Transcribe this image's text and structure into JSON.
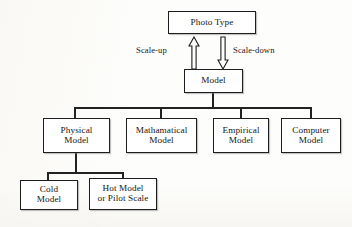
{
  "diagram": {
    "background_color": "#fdfdfb",
    "line_color": "#222222",
    "text_color": "#161616",
    "nodes": {
      "photo_type": "Photo Type",
      "model": "Model",
      "physical_model": "Physical\nModel",
      "mathematical_model": "Mathamatical\nModel",
      "empirical_model": "Empirical\nModel",
      "computer_model": "Computer\nModel",
      "cold_model": "Cold\nModel",
      "hot_model": "Hot Model\nor Pilot Scale"
    },
    "arrows": {
      "scale_up_label": "Scale-up",
      "scale_down_label": "Scale-down",
      "scale_up_icon": "block-arrow-up-icon",
      "scale_down_icon": "block-arrow-down-icon"
    },
    "edges": {
      "model_stem": "model-to-branch-bus",
      "bus_main": "four-way-branch-bus",
      "drop_physical": "bus-to-physical-model",
      "drop_mathematical": "bus-to-mathematical-model",
      "drop_empirical": "bus-to-empirical-model",
      "drop_computer": "bus-to-computer-model",
      "physical_stem": "physical-model-to-lower-bus",
      "bus_lower": "two-way-branch-bus",
      "drop_cold": "lower-bus-to-cold-model",
      "drop_hot": "lower-bus-to-hot-model"
    }
  }
}
